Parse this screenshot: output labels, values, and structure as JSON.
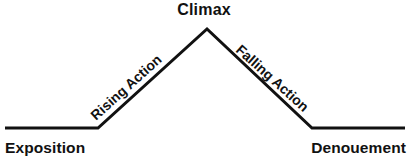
{
  "diagram": {
    "title_text": "Climax",
    "type": "plot-structure-diagram",
    "background_color": "#ffffff",
    "line_color": "#111111",
    "line_width_px": 3,
    "labels": {
      "climax": "Climax",
      "exposition": "Exposition",
      "denouement": "Denouement",
      "rising_action": "Rising Action",
      "falling_action": "Falling Action"
    }
  },
  "chart_data": {
    "type": "line",
    "title": "",
    "xlabel": "",
    "ylabel": "",
    "grid": false,
    "legend_position": "none",
    "categories": [
      "Exposition",
      "Rising Action",
      "Climax",
      "Falling Action",
      "Denouement"
    ],
    "x": [
      5,
      98,
      207,
      312,
      405
    ],
    "values": [
      128,
      128,
      29,
      128,
      128
    ],
    "annotations": [
      {
        "text": "Climax",
        "x": 207,
        "y": 10,
        "rotation": 0
      },
      {
        "text": "Rising Action",
        "x": 88,
        "y": 112,
        "rotation": -42
      },
      {
        "text": "Falling Action",
        "x": 243,
        "y": 42,
        "rotation": 42
      },
      {
        "text": "Exposition",
        "x": 5,
        "y": 148,
        "rotation": 0
      },
      {
        "text": "Denouement",
        "x": 405,
        "y": 148,
        "rotation": 0
      }
    ],
    "series": [
      {
        "name": "plot-arc",
        "points": [
          {
            "x": 5,
            "y": 128
          },
          {
            "x": 98,
            "y": 128
          },
          {
            "x": 207,
            "y": 29
          },
          {
            "x": 312,
            "y": 128
          },
          {
            "x": 405,
            "y": 128
          }
        ]
      }
    ],
    "xlim": [
      0,
      408
    ],
    "ylim": [
      161,
      0
    ]
  }
}
